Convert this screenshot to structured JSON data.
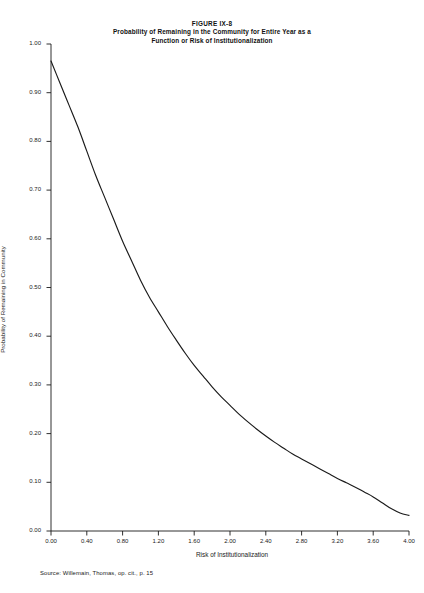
{
  "figure": {
    "number": "FIGURE IX-8",
    "subtitle_line1": "Probability of Remaining in the Community for Entire Year as a",
    "subtitle_line2": "Function or Risk of Institutionalization",
    "source": "Source:  Willemain, Thomas, op. cit., p. 15"
  },
  "chart_data": {
    "type": "line",
    "title": "Probability of Remaining in the Community for Entire Year as a Function or Risk of Institutionalization",
    "xlabel": "Risk of Institutionalization",
    "ylabel": "Probability of Remaining in Community",
    "xlim": [
      0.0,
      4.0
    ],
    "ylim": [
      0.0,
      1.0
    ],
    "grid": false,
    "legend": false,
    "xticks": [
      "0.00",
      "0.40",
      "0.80",
      "1.20",
      "1.60",
      "2.00",
      "2.40",
      "2.80",
      "3.20",
      "3.60",
      "4.00"
    ],
    "xtick_values": [
      0.0,
      0.4,
      0.8,
      1.2,
      1.6,
      2.0,
      2.4,
      2.8,
      3.2,
      3.6,
      4.0
    ],
    "yticks": [
      "0.00",
      "0.10",
      "0.20",
      "0.30",
      "0.40",
      "0.50",
      "0.60",
      "0.70",
      "0.80",
      "0.90",
      "1.00"
    ],
    "ytick_values": [
      0.0,
      0.1,
      0.2,
      0.3,
      0.4,
      0.5,
      0.6,
      0.7,
      0.8,
      0.9,
      1.0
    ],
    "line_color": "#1a1a1a",
    "series": [
      {
        "name": "Probability of Remaining in Community",
        "x": [
          0.0,
          0.1,
          0.2,
          0.3,
          0.4,
          0.5,
          0.6,
          0.7,
          0.8,
          0.9,
          1.0,
          1.1,
          1.2,
          1.3,
          1.4,
          1.5,
          1.6,
          1.7,
          1.8,
          1.9,
          2.0,
          2.1,
          2.2,
          2.3,
          2.4,
          2.5,
          2.6,
          2.7,
          2.8,
          2.9,
          3.0,
          3.1,
          3.2,
          3.3,
          3.4,
          3.5,
          3.6,
          3.7,
          3.8,
          3.9,
          4.0
        ],
        "y": [
          0.965,
          0.92,
          0.875,
          0.83,
          0.78,
          0.73,
          0.685,
          0.64,
          0.595,
          0.555,
          0.515,
          0.48,
          0.45,
          0.42,
          0.392,
          0.365,
          0.34,
          0.318,
          0.296,
          0.276,
          0.258,
          0.24,
          0.224,
          0.209,
          0.195,
          0.182,
          0.17,
          0.158,
          0.148,
          0.138,
          0.128,
          0.118,
          0.108,
          0.099,
          0.09,
          0.08,
          0.07,
          0.058,
          0.046,
          0.037,
          0.032
        ]
      }
    ]
  }
}
